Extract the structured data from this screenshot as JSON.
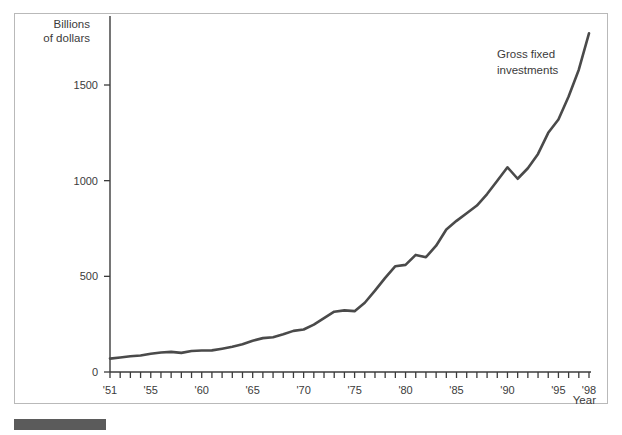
{
  "figure": {
    "caption_bar_color": "#5b5b5b",
    "frame_color": "#b9b9b9"
  },
  "chart_data": {
    "type": "line",
    "title": "",
    "subtitle": "",
    "xlabel": "Year",
    "ylabel": "Billions of dollars",
    "ylabel_line1": "Billions",
    "ylabel_line2": "of dollars",
    "grid": false,
    "legend_position": "inline-annotation",
    "annotations": [
      {
        "text": "Gross fixed investments",
        "line1": "Gross fixed",
        "line2": "investments",
        "x": 1993,
        "y": 1640
      }
    ],
    "series_color": "#4a4a4a",
    "axis_color": "#3b3b3b",
    "xlim": [
      1951,
      1998
    ],
    "ylim": [
      0,
      1800
    ],
    "ytick_values": [
      0,
      500,
      1000,
      1500
    ],
    "ytick_labels": [
      "0",
      "500",
      "1000",
      "1500"
    ],
    "xtick_values": [
      1951,
      1952,
      1953,
      1954,
      1955,
      1956,
      1957,
      1958,
      1959,
      1960,
      1961,
      1962,
      1963,
      1964,
      1965,
      1966,
      1967,
      1968,
      1969,
      1970,
      1971,
      1972,
      1973,
      1974,
      1975,
      1976,
      1977,
      1978,
      1979,
      1980,
      1981,
      1982,
      1983,
      1984,
      1985,
      1986,
      1987,
      1988,
      1989,
      1990,
      1991,
      1992,
      1993,
      1994,
      1995,
      1996,
      1997,
      1998
    ],
    "xtick_labels": [
      {
        "value": 1951,
        "label": "'51"
      },
      {
        "value": 1955,
        "label": "'55"
      },
      {
        "value": 1960,
        "label": "'60"
      },
      {
        "value": 1965,
        "label": "'65"
      },
      {
        "value": 1970,
        "label": "'70"
      },
      {
        "value": 1975,
        "label": "'75"
      },
      {
        "value": 1980,
        "label": "'80"
      },
      {
        "value": 1985,
        "label": "'85"
      },
      {
        "value": 1990,
        "label": "'90"
      },
      {
        "value": 1995,
        "label": "'95"
      },
      {
        "value": 1998,
        "label": "'98"
      }
    ],
    "series": [
      {
        "name": "Gross fixed investments",
        "x": [
          1951,
          1952,
          1953,
          1954,
          1955,
          1956,
          1957,
          1958,
          1959,
          1960,
          1961,
          1962,
          1963,
          1964,
          1965,
          1966,
          1967,
          1968,
          1969,
          1970,
          1971,
          1972,
          1973,
          1974,
          1975,
          1976,
          1977,
          1978,
          1979,
          1980,
          1981,
          1982,
          1983,
          1984,
          1985,
          1986,
          1987,
          1988,
          1989,
          1990,
          1991,
          1992,
          1993,
          1994,
          1995,
          1996,
          1997,
          1998
        ],
        "values": [
          70,
          76,
          82,
          86,
          95,
          102,
          105,
          100,
          110,
          112,
          113,
          122,
          132,
          145,
          163,
          177,
          182,
          197,
          215,
          222,
          248,
          282,
          315,
          322,
          318,
          362,
          425,
          492,
          553,
          560,
          612,
          600,
          660,
          745,
          790,
          830,
          870,
          930,
          1000,
          1070,
          1010,
          1065,
          1140,
          1250,
          1320,
          1440,
          1580,
          1770
        ]
      }
    ]
  }
}
